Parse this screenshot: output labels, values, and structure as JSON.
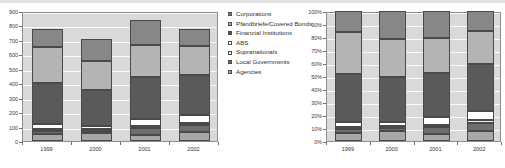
{
  "legend": {
    "position": "center-between-charts",
    "entries": [
      {
        "label": "Corporations",
        "color": "#878787"
      },
      {
        "label": "Pfandbriefe/Covered Bonds",
        "color": "#b4b4b4"
      },
      {
        "label": "Financial Institutions",
        "color": "#5a5a5a"
      },
      {
        "label": "ABS",
        "color": "#ffffff"
      },
      {
        "label": "Supranationals",
        "color": "#efefef"
      },
      {
        "label": "Local Governments",
        "color": "#6e6e6e"
      },
      {
        "label": "Agencies",
        "color": "#a8a8a8"
      }
    ]
  },
  "chart_data": [
    {
      "type": "bar",
      "title": "",
      "subtitle": "",
      "xlabel": "",
      "ylabel": "",
      "stacked": true,
      "normalized": false,
      "grid": true,
      "legend_position": "right",
      "categories": [
        "1999",
        "2000",
        "2001",
        "2002"
      ],
      "ylim": [
        0,
        900
      ],
      "yticks": [
        0,
        100,
        200,
        300,
        400,
        500,
        600,
        700,
        800,
        900
      ],
      "ytick_labels": [
        "0",
        "100",
        "200",
        "300",
        "400",
        "500",
        "600",
        "700",
        "800",
        "900"
      ],
      "series": [
        {
          "name": "Agencies",
          "color": "#a8a8a8",
          "values": [
            50,
            55,
            45,
            60
          ]
        },
        {
          "name": "Local Governments",
          "color": "#6e6e6e",
          "values": [
            20,
            15,
            45,
            50
          ]
        },
        {
          "name": "Supranationals",
          "color": "#efefef",
          "values": [
            15,
            10,
            15,
            15
          ]
        },
        {
          "name": "ABS",
          "color": "#ffffff",
          "values": [
            30,
            25,
            50,
            55
          ]
        },
        {
          "name": "Financial Institutions",
          "color": "#5a5a5a",
          "values": [
            285,
            245,
            285,
            280
          ]
        },
        {
          "name": "Pfandbriefe/Covered Bonds",
          "color": "#b4b4b4",
          "values": [
            250,
            205,
            225,
            195
          ]
        },
        {
          "name": "Corporations",
          "color": "#878787",
          "values": [
            125,
            150,
            175,
            120
          ]
        }
      ],
      "totals": [
        775,
        705,
        840,
        775
      ]
    },
    {
      "type": "bar",
      "title": "",
      "subtitle": "",
      "xlabel": "",
      "ylabel": "",
      "stacked": true,
      "normalized": true,
      "grid": true,
      "legend_position": "left",
      "categories": [
        "1999",
        "2000",
        "2001",
        "2002"
      ],
      "ylim": [
        0,
        100
      ],
      "yticks": [
        0,
        10,
        20,
        30,
        40,
        50,
        60,
        70,
        80,
        90,
        100
      ],
      "ytick_labels": [
        "0%",
        "10%",
        "20%",
        "30%",
        "40%",
        "50%",
        "60%",
        "70%",
        "80%",
        "90%",
        "100%"
      ],
      "series": [
        {
          "name": "Agencies",
          "color": "#a8a8a8",
          "values": [
            6.5,
            7.8,
            5.4,
            7.7
          ]
        },
        {
          "name": "Local Governments",
          "color": "#6e6e6e",
          "values": [
            2.6,
            2.1,
            5.4,
            6.5
          ]
        },
        {
          "name": "Supranationals",
          "color": "#efefef",
          "values": [
            1.9,
            1.4,
            1.8,
            1.9
          ]
        },
        {
          "name": "ABS",
          "color": "#ffffff",
          "values": [
            3.9,
            3.5,
            6.0,
            7.1
          ]
        },
        {
          "name": "Financial Institutions",
          "color": "#5a5a5a",
          "values": [
            36.8,
            34.8,
            33.9,
            36.1
          ]
        },
        {
          "name": "Pfandbriefe/Covered Bonds",
          "color": "#b4b4b4",
          "values": [
            32.3,
            29.1,
            26.8,
            25.2
          ]
        },
        {
          "name": "Corporations",
          "color": "#878787",
          "values": [
            16.0,
            21.3,
            20.7,
            15.5
          ]
        }
      ],
      "totals": [
        100,
        100,
        100,
        100
      ]
    }
  ]
}
